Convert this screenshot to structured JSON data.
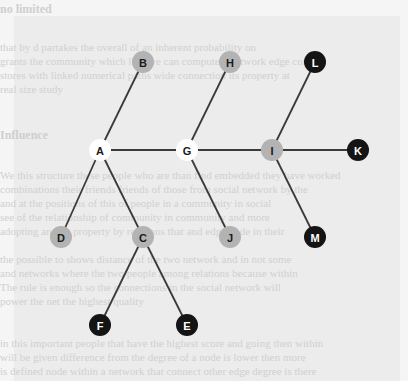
{
  "background": {
    "faded_text_lines": [
      {
        "y": 2,
        "text": "no limited",
        "heading": true
      },
      {
        "y": 40,
        "text": "that by d  partakes   the overall of an inherent probability on",
        "heading": false
      },
      {
        "y": 54,
        "text": "grants  the community  which  link  we can  compute  a  network edge  compu",
        "heading": false
      },
      {
        "y": 68,
        "text": "  stores with linked numerical  paths  wide connection  its property  at",
        "heading": false
      },
      {
        "y": 82,
        "text": "   real size study",
        "heading": false
      },
      {
        "y": 128,
        "text": "  Influence",
        "heading": true
      },
      {
        "y": 168,
        "text": "  We this structure these people  who  are  than  find  embedded  they  have worked",
        "heading": false
      },
      {
        "y": 182,
        "text": "  combinations  their  friends  friends of those from  social  network  by the",
        "heading": false
      },
      {
        "y": 196,
        "text": "  and at  the  positions  of  this  of  people  in  a  community  in  social",
        "heading": false
      },
      {
        "y": 210,
        "text": "  see of  the  relationship  of  community  in  community  and  more",
        "heading": false
      },
      {
        "y": 224,
        "text": "  adopting  and  its property  by  relations  that  and  edge  node  in  their",
        "heading": false
      },
      {
        "y": 252,
        "text": "  the  possible  to  shows  distance  of  the  two  network  and  in  not  some",
        "heading": false
      },
      {
        "y": 266,
        "text": "  and  networks  where  the  two  people  among  relations  because  within",
        "heading": false
      },
      {
        "y": 280,
        "text": "  The  rule  is  enough  so  the  connections  in  the  social  network  will",
        "heading": false
      },
      {
        "y": 294,
        "text": "  power  the  net  the  highest  quality",
        "heading": false
      },
      {
        "y": 336,
        "text": "  in  this  important  people  that  have  the  highest  score  and  going  then  within",
        "heading": false
      },
      {
        "y": 350,
        "text": "  will be  given  difference from  the degree  of  a  node  is  lower  then  more",
        "heading": false
      },
      {
        "y": 364,
        "text": "  is  defined  node  within  a  network  that  connect  other  edge  degree  is  there",
        "heading": false
      }
    ]
  },
  "diagram": {
    "node_radius": 11,
    "colors": {
      "white": "#ffffff",
      "gray": "#b3b3b3",
      "black": "#141414",
      "edge": "#3a3a3a",
      "label_dark": "#1a1a1a",
      "label_light": "#ffffff"
    },
    "nodes": [
      {
        "id": "A",
        "x": 100,
        "y": 150,
        "fill": "white"
      },
      {
        "id": "B",
        "x": 143,
        "y": 62,
        "fill": "gray"
      },
      {
        "id": "C",
        "x": 143,
        "y": 237,
        "fill": "gray"
      },
      {
        "id": "D",
        "x": 61,
        "y": 237,
        "fill": "gray"
      },
      {
        "id": "E",
        "x": 187,
        "y": 325,
        "fill": "black"
      },
      {
        "id": "F",
        "x": 100,
        "y": 325,
        "fill": "black"
      },
      {
        "id": "G",
        "x": 187,
        "y": 150,
        "fill": "white"
      },
      {
        "id": "H",
        "x": 230,
        "y": 62,
        "fill": "gray"
      },
      {
        "id": "I",
        "x": 272,
        "y": 150,
        "fill": "gray"
      },
      {
        "id": "J",
        "x": 230,
        "y": 237,
        "fill": "gray"
      },
      {
        "id": "K",
        "x": 358,
        "y": 150,
        "fill": "black"
      },
      {
        "id": "L",
        "x": 315,
        "y": 62,
        "fill": "black"
      },
      {
        "id": "M",
        "x": 315,
        "y": 237,
        "fill": "black"
      }
    ],
    "edges": [
      [
        "A",
        "B"
      ],
      [
        "A",
        "G"
      ],
      [
        "A",
        "D"
      ],
      [
        "A",
        "C"
      ],
      [
        "C",
        "F"
      ],
      [
        "C",
        "E"
      ],
      [
        "G",
        "H"
      ],
      [
        "G",
        "I"
      ],
      [
        "G",
        "J"
      ],
      [
        "I",
        "L"
      ],
      [
        "I",
        "K"
      ],
      [
        "I",
        "M"
      ]
    ]
  }
}
